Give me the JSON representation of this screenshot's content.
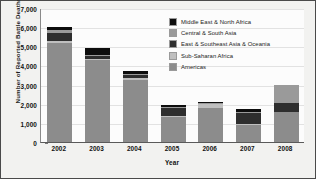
{
  "chart_data": {
    "type": "bar",
    "subtype": "stacked-bar",
    "title": "",
    "xlabel": "Year",
    "ylabel": "Number of Reported Battle Deaths",
    "categories": [
      "2002",
      "2003",
      "2004",
      "2005",
      "2006",
      "2007",
      "2008"
    ],
    "ylim": [
      0,
      7000
    ],
    "ytick_labels": [
      "0",
      "1,000",
      "2,000",
      "3,000",
      "4,000",
      "5,000",
      "6,000",
      "7,000"
    ],
    "ytick_values": [
      0,
      1000,
      2000,
      3000,
      4000,
      5000,
      6000,
      7000
    ],
    "ytick_step": 1000,
    "grid": "horizontal",
    "legend_position": "top-right-inside",
    "stack_order_bottom_to_top": [
      "Americas",
      "Sub-Saharan Africa",
      "East & Southeast Asia & Oceania",
      "Central & South Asia",
      "Middle East & North Africa"
    ],
    "series": [
      {
        "name": "Americas",
        "color": "#8c8c8c",
        "values": [
          5150,
          4280,
          3250,
          1300,
          1800,
          900,
          1550
        ]
      },
      {
        "name": "Sub-Saharan Africa",
        "color": "#bfbfbf",
        "values": [
          120,
          80,
          70,
          60,
          240,
          60,
          0
        ]
      },
      {
        "name": "East & Southeast Asia & Oceania",
        "color": "#2e2e2e",
        "values": [
          440,
          140,
          180,
          410,
          0,
          550,
          500
        ]
      },
      {
        "name": "Central & South Asia",
        "color": "#9a9a9a",
        "values": [
          120,
          70,
          60,
          60,
          10,
          60,
          950
        ]
      },
      {
        "name": "Middle East & North Africa",
        "color": "#0d0d0d",
        "values": [
          170,
          330,
          140,
          120,
          50,
          180,
          0
        ]
      }
    ],
    "totals": [
      6000,
      4900,
      3700,
      1950,
      2100,
      1750,
      3000
    ]
  },
  "legend": {
    "items": [
      {
        "label": "Middle East & North Africa",
        "color": "#0d0d0d"
      },
      {
        "label": "Central & South Asia",
        "color": "#9a9a9a"
      },
      {
        "label": "East & Southeast Asia & Oceania",
        "color": "#2e2e2e"
      },
      {
        "label": "Sub-Saharan Africa",
        "color": "#bfbfbf"
      },
      {
        "label": "Americas",
        "color": "#8c8c8c"
      }
    ]
  }
}
